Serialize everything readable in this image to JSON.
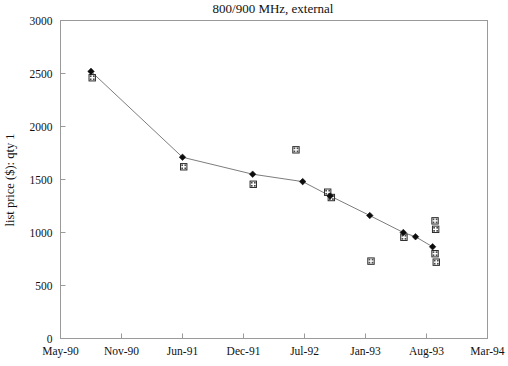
{
  "chart_data": {
    "type": "scatter",
    "title": "800/900 MHz, external",
    "xlabel": "",
    "ylabel": "list price ($): qty 1",
    "xlim": [
      0,
      7
    ],
    "ylim": [
      0,
      3000
    ],
    "grid": false,
    "legend": "none",
    "x_tick_labels": [
      "May-90",
      "Nov-90",
      "Jun-91",
      "Dec-91",
      "Jul-92",
      "Jan-93",
      "Aug-93",
      "Mar-94"
    ],
    "y_tick_labels": [
      "0",
      "500",
      "1000",
      "1500",
      "2000",
      "2500",
      "3000"
    ],
    "y_tick_values": [
      0,
      500,
      1000,
      1500,
      2000,
      2500,
      3000
    ],
    "series": [
      {
        "name": "trend-diamonds",
        "marker": "filled-diamond",
        "connected": true,
        "points": [
          {
            "x": 0.5,
            "y": 2520
          },
          {
            "x": 2.0,
            "y": 1710
          },
          {
            "x": 3.15,
            "y": 1550
          },
          {
            "x": 3.97,
            "y": 1480
          },
          {
            "x": 4.42,
            "y": 1345
          },
          {
            "x": 5.07,
            "y": 1160
          },
          {
            "x": 5.62,
            "y": 1000
          },
          {
            "x": 5.82,
            "y": 960
          },
          {
            "x": 6.1,
            "y": 865
          }
        ]
      },
      {
        "name": "observed-squares",
        "marker": "hatched-square",
        "connected": false,
        "points": [
          {
            "x": 0.52,
            "y": 2460
          },
          {
            "x": 2.02,
            "y": 1620
          },
          {
            "x": 3.16,
            "y": 1455
          },
          {
            "x": 3.86,
            "y": 1780
          },
          {
            "x": 4.38,
            "y": 1380
          },
          {
            "x": 4.44,
            "y": 1330
          },
          {
            "x": 5.09,
            "y": 730
          },
          {
            "x": 5.63,
            "y": 955
          },
          {
            "x": 6.14,
            "y": 1110
          },
          {
            "x": 6.15,
            "y": 1030
          },
          {
            "x": 6.16,
            "y": 720
          },
          {
            "x": 6.14,
            "y": 800
          }
        ]
      }
    ]
  }
}
